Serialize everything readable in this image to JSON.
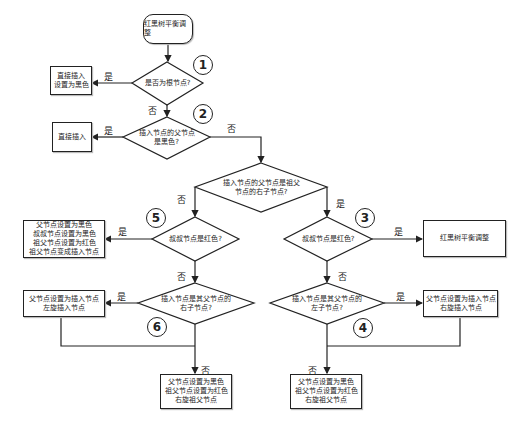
{
  "start": {
    "label": "红黑树平衡调整"
  },
  "decisions": {
    "d1": {
      "text": "是否为根节点?",
      "marker": "1"
    },
    "d2": {
      "line1": "插入节点的父节点",
      "line2": "是黑色?",
      "marker": "2"
    },
    "dc": {
      "line1": "插入节点的父节点是祖父",
      "line2": "节点的右子节点?"
    },
    "d5": {
      "text": "叔叔节点是红色?",
      "marker": "5"
    },
    "d3": {
      "text": "叔叔节点是红色?",
      "marker": "3"
    },
    "d6": {
      "line1": "插入节点是其父节点的",
      "line2": "右子节点?",
      "marker": "6"
    },
    "d4": {
      "line1": "插入节点是其父节点的",
      "line2": "左子节点?",
      "marker": "4"
    }
  },
  "actions": {
    "a1": {
      "line1": "直接插入",
      "line2": "设置为黑色"
    },
    "a2": {
      "line1": "直接插入"
    },
    "a5": {
      "line1": "父节点设置为黑色",
      "line2": "叔叔节点设置为黑色",
      "line3": "祖父节点设置为红色",
      "line4": "祖父节点变成插入节点"
    },
    "a3": {
      "line1": "红黑树平衡调整"
    },
    "a6": {
      "line1": "父节点设置为插入节点",
      "line2": "左旋插入节点"
    },
    "a4": {
      "line1": "父节点设置为插入节点",
      "line2": "右旋插入节点"
    },
    "aL": {
      "line1": "父节点设置为黑色",
      "line2": "祖父节点设置为红色",
      "line3": "右旋祖父节点"
    },
    "aR": {
      "line1": "父节点设置为黑色",
      "line2": "祖父节点设置为红色",
      "line3": "右旋祖父节点"
    }
  },
  "edge_labels": {
    "yes": "是",
    "no": "否"
  },
  "colors": {
    "stroke": "#222222",
    "background": "#ffffff"
  }
}
